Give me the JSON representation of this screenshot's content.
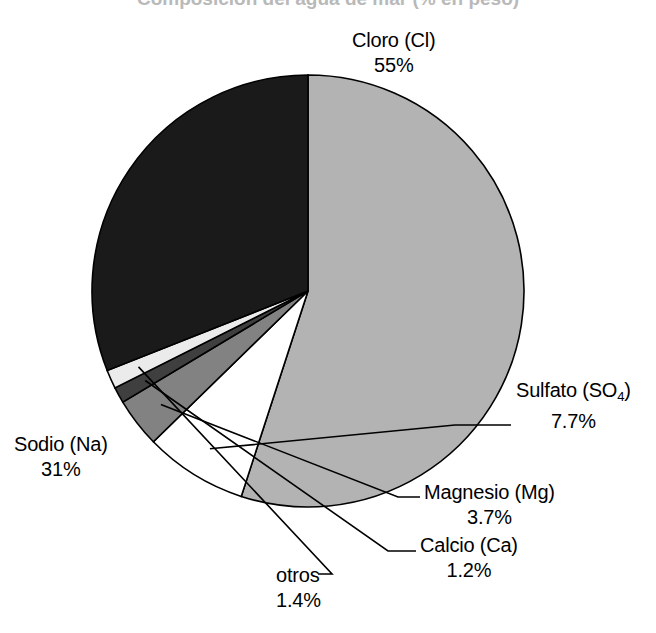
{
  "title": {
    "text": "Composición del agua de mar (% en peso)",
    "visible_state": "cropped-at-top"
  },
  "chart_data": {
    "type": "pie",
    "title": "Composición del agua de mar (% en peso)",
    "subtitle": "",
    "xlabel": "",
    "ylabel": "",
    "legend_position": "none",
    "grid": false,
    "units": "percent",
    "total": 100,
    "start_angle_deg": 0,
    "direction": "clockwise",
    "categories": [
      "Cloro (Cl)",
      "Sulfato (SO4)",
      "Magnesio (Mg)",
      "Calcio (Ca)",
      "otros",
      "Sodio (Na)"
    ],
    "values": [
      55,
      7.7,
      3.7,
      1.2,
      1.4,
      31
    ],
    "slices": [
      {
        "id": "cloro",
        "name_main": "Cloro (Cl)",
        "name_prefix": "Cloro (Cl",
        "name_sub": "",
        "name_suffix": ")",
        "value": 55,
        "value_label": "55%",
        "color": "#b3b3b3",
        "leader": false
      },
      {
        "id": "sulfato",
        "name_main": "Sulfato (SO4)",
        "name_prefix": "Sulfato (SO",
        "name_sub": "4",
        "name_suffix": ")",
        "value": 7.7,
        "value_label": "7.7%",
        "color": "#ffffff",
        "leader": true
      },
      {
        "id": "magnesio",
        "name_main": "Magnesio (Mg)",
        "name_prefix": "Magnesio (Mg",
        "name_sub": "",
        "name_suffix": ")",
        "value": 3.7,
        "value_label": "3.7%",
        "color": "#828282",
        "leader": true
      },
      {
        "id": "calcio",
        "name_main": "Calcio (Ca)",
        "name_prefix": "Calcio (Ca",
        "name_sub": "",
        "name_suffix": ")",
        "value": 1.2,
        "value_label": "1.2%",
        "color": "#3f3f3f",
        "leader": true
      },
      {
        "id": "otros",
        "name_main": "otros",
        "name_prefix": "otros",
        "name_sub": "",
        "name_suffix": "",
        "value": 1.4,
        "value_label": "1.4%",
        "color": "#ebebeb",
        "leader": true
      },
      {
        "id": "sodio",
        "name_main": "Sodio (Na)",
        "name_prefix": "Sodio (Na",
        "name_sub": "",
        "name_suffix": ")",
        "value": 31,
        "value_label": "31%",
        "color": "#1a1a1a",
        "leader": false
      }
    ]
  },
  "geometry": {
    "center_x": 308,
    "center_y": 291,
    "radius": 216,
    "outline_color": "#000000",
    "outline_width": 1.6,
    "background": "#ffffff"
  }
}
